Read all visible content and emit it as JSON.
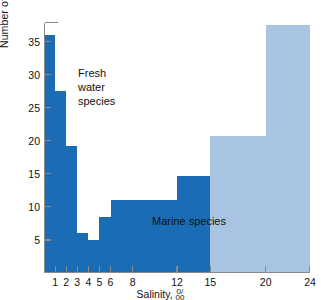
{
  "chart_data": {
    "type": "area",
    "title": "",
    "xlabel": "Salinity, ‰",
    "ylabel": "Number of Mollusk species",
    "xlim": [
      0,
      24
    ],
    "ylim": [
      0,
      38
    ],
    "grid": false,
    "legend_position": "inline-annotations",
    "xtick_labels": [
      "1",
      "2",
      "3",
      "4",
      "5",
      "6",
      "8",
      "12",
      "15",
      "20",
      "24"
    ],
    "xtick_values": [
      1,
      2,
      3,
      4,
      5,
      6,
      8,
      12,
      15,
      20,
      24
    ],
    "ytick_labels": [
      "5",
      "10",
      "15",
      "20",
      "25",
      "30",
      "35"
    ],
    "ytick_values": [
      5,
      10,
      15,
      20,
      25,
      30,
      35
    ],
    "annotations": [
      {
        "text": "Fresh\nwater\nspecies",
        "x": 2.6,
        "y": 26
      },
      {
        "text": "Marine species",
        "x": 11.5,
        "y": 7.5
      }
    ],
    "series": [
      {
        "name": "Fresh water species",
        "color": "#1a6cb5",
        "bins": [
          {
            "x0": 0,
            "x1": 1,
            "value": 36
          },
          {
            "x0": 1,
            "x1": 2,
            "value": 27.5
          },
          {
            "x0": 2,
            "x1": 3,
            "value": 19.3
          },
          {
            "x0": 3,
            "x1": 4,
            "value": 6
          },
          {
            "x0": 4,
            "x1": 5,
            "value": 5
          },
          {
            "x0": 5,
            "x1": 6,
            "value": 8.5
          },
          {
            "x0": 6,
            "x1": 12,
            "value": 11
          },
          {
            "x0": 12,
            "x1": 15,
            "value": 14.7
          },
          {
            "x0": 15,
            "x1": 20,
            "value": 0
          },
          {
            "x0": 20,
            "x1": 24,
            "value": 0
          }
        ]
      },
      {
        "name": "Marine species",
        "color": "#a8c4e0",
        "bins": [
          {
            "x0": 0,
            "x1": 1,
            "value": 0
          },
          {
            "x0": 1,
            "x1": 2,
            "value": 2
          },
          {
            "x0": 2,
            "x1": 3,
            "value": 2
          },
          {
            "x0": 3,
            "x1": 4,
            "value": 2
          },
          {
            "x0": 4,
            "x1": 5,
            "value": 2
          },
          {
            "x0": 5,
            "x1": 6,
            "value": 6
          },
          {
            "x0": 6,
            "x1": 12,
            "value": 10.4
          },
          {
            "x0": 12,
            "x1": 15,
            "value": 14
          },
          {
            "x0": 15,
            "x1": 20,
            "value": 20.7
          },
          {
            "x0": 20,
            "x1": 24,
            "value": 37.5
          }
        ]
      }
    ]
  },
  "axes": {
    "y_title": "Number of Mollusk species",
    "x_title_prefix": "Salinity, ",
    "x_title_permille_num": "0/",
    "x_title_permille_den": "00"
  },
  "labels": {
    "fresh": "Fresh\nwater\nspecies",
    "marine": "Marine species"
  },
  "colors": {
    "fresh_water": "#1a6cb5",
    "marine": "#a8c4e0",
    "axis": "#8a8a8a",
    "text": "#111111",
    "background": "#ffffff"
  }
}
